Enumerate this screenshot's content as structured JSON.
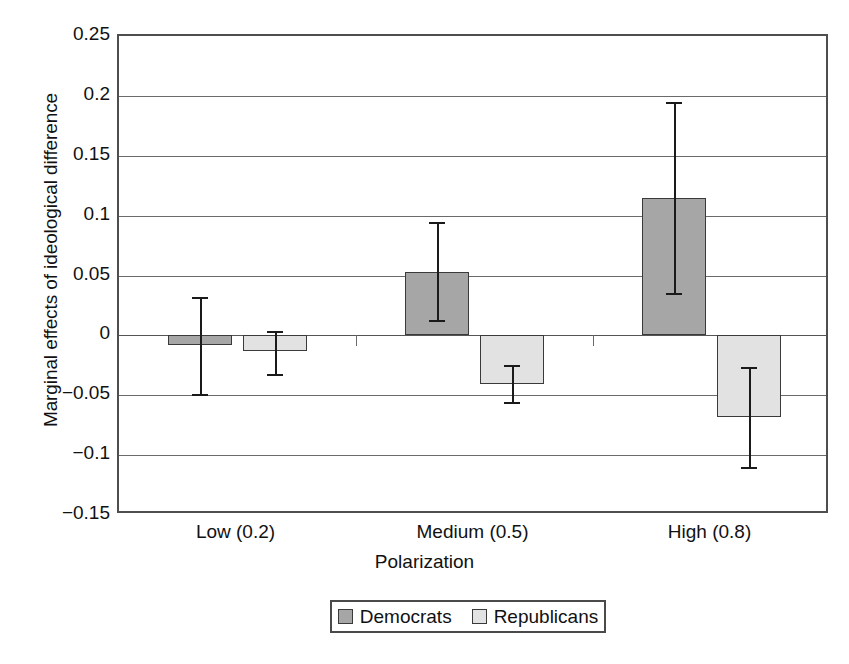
{
  "chart_data": {
    "type": "bar",
    "title": "",
    "xlabel": "Polarization",
    "ylabel": "Marginal effects of ideological difference",
    "categories": [
      "Low (0.2)",
      "Medium (0.5)",
      "High (0.8)"
    ],
    "ylim": [
      -0.15,
      0.25
    ],
    "yticks": [
      "0.25",
      "0.2",
      "0.15",
      "0.1",
      "0.05",
      "0",
      "-0.05",
      "-0.1",
      "-0.15"
    ],
    "ytick_values": [
      0.25,
      0.2,
      0.15,
      0.1,
      0.05,
      0,
      -0.05,
      -0.1,
      -0.15
    ],
    "grid": true,
    "legend_position": "bottom-center",
    "error_bars": true,
    "series": [
      {
        "name": "Democrats",
        "color": "#a6a6a6",
        "values": [
          -0.008,
          0.053,
          0.115
        ],
        "err_low": [
          -0.049,
          0.013,
          0.035
        ],
        "err_high": [
          0.032,
          0.095,
          0.195
        ]
      },
      {
        "name": "Republicans",
        "color": "#e2e2e2",
        "values": [
          -0.013,
          -0.041,
          -0.068
        ],
        "err_low": [
          -0.032,
          -0.056,
          -0.11
        ],
        "err_high": [
          0.004,
          -0.025,
          -0.026
        ]
      }
    ]
  },
  "legend": {
    "entries": [
      {
        "label": "Democrats",
        "swatch": "dem"
      },
      {
        "label": "Republicans",
        "swatch": "rep"
      }
    ]
  },
  "axes": {
    "y_title": "Marginal effects of ideological difference",
    "x_title": "Polarization"
  }
}
